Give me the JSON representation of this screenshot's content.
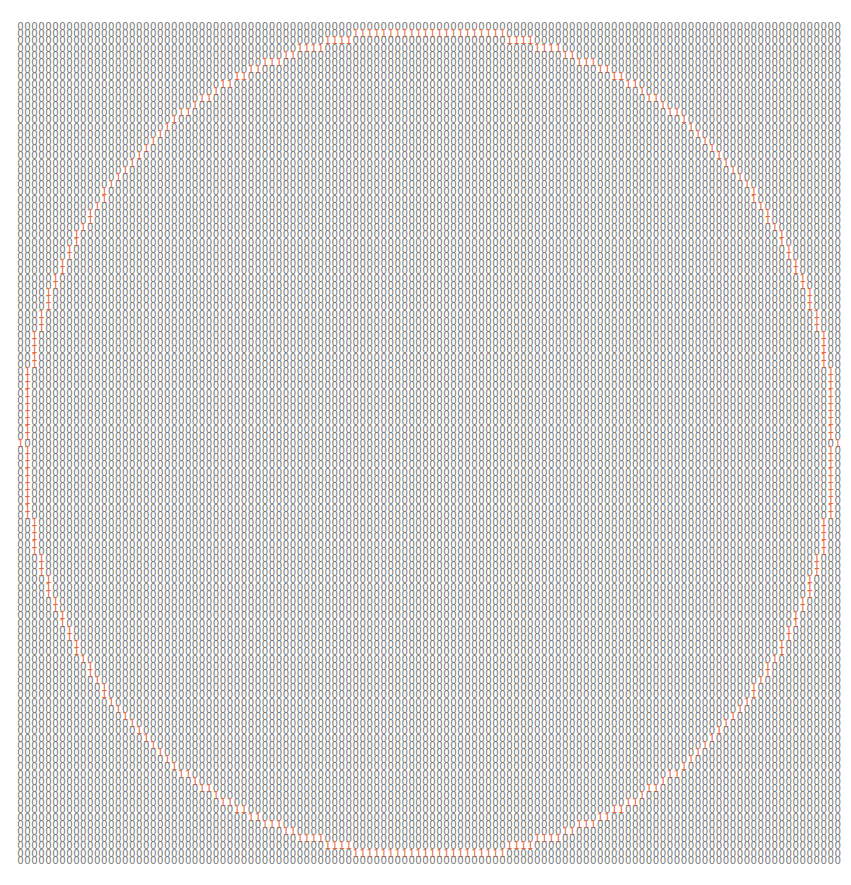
{
  "grid": {
    "rows": 117,
    "cols": 118,
    "zero_char": "0",
    "one_char": "1",
    "colors": {
      "zero": "#7a7a7a",
      "one": "#e8693f",
      "background": "#ffffff"
    },
    "shape": {
      "type": "circle-outline",
      "center_col": 58.5,
      "center_row": 58,
      "radius_cols": 58.5,
      "radius_rows": 58
    }
  }
}
